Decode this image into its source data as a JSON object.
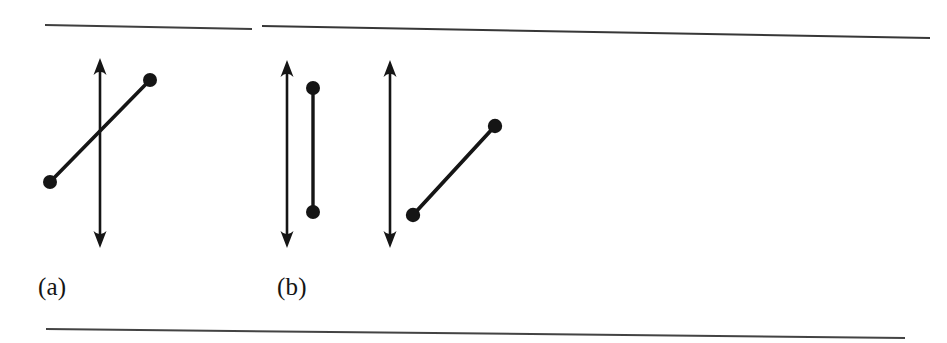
{
  "figure": {
    "kind": "scanned-textbook-figure",
    "background_color": "#ffffff",
    "ink_color": "#151515",
    "width": 947,
    "height": 343,
    "panels": [
      {
        "id": "panel-a",
        "label": "(a)",
        "label_position": {
          "x": 38,
          "y": 274
        },
        "description": "A vertical double-headed arrow crossed by an oblique segment with round endpoints"
      },
      {
        "id": "panel-b",
        "label": "(b)",
        "label_position": {
          "x": 277,
          "y": 274
        },
        "description": "Two vertical double-headed arrows, one beside a vertical segment and one beside an oblique segment, both segments with round endpoints"
      }
    ],
    "rules": [
      {
        "name": "top-rule-left",
        "x1": 45,
        "y1": 25,
        "x2": 252,
        "y2": 29,
        "thickness": 2.0,
        "opacity": 0.82
      },
      {
        "name": "top-rule-right",
        "x1": 262,
        "y1": 26,
        "x2": 930,
        "y2": 38,
        "thickness": 2.0,
        "opacity": 0.85
      },
      {
        "name": "bottom-rule",
        "x1": 46,
        "y1": 329,
        "x2": 905,
        "y2": 338,
        "thickness": 2.0,
        "opacity": 0.8
      }
    ],
    "arrows": [
      {
        "name": "arrow-a-line",
        "panel": "panel-a",
        "x": 100,
        "y_top": 58,
        "y_bottom": 248,
        "thickness": 2.6,
        "head_half_width": 6.5,
        "head_length": 17
      },
      {
        "name": "arrow-b-left-line",
        "panel": "panel-b",
        "x": 287,
        "y_top": 60,
        "y_bottom": 248,
        "thickness": 2.6,
        "head_half_width": 6.5,
        "head_length": 17
      },
      {
        "name": "arrow-b-right-line",
        "panel": "panel-b",
        "x": 390,
        "y_top": 60,
        "y_bottom": 248,
        "thickness": 2.6,
        "head_half_width": 6.5,
        "head_length": 17
      }
    ],
    "segments": [
      {
        "name": "segment-a-oblique",
        "panel": "panel-a",
        "x1": 50,
        "y1": 182,
        "x2": 150,
        "y2": 80,
        "thickness": 3.6,
        "endpoint_radius": 7.0
      },
      {
        "name": "segment-b-vertical",
        "panel": "panel-b",
        "x1": 313,
        "y1": 88,
        "x2": 313,
        "y2": 212,
        "thickness": 3.4,
        "endpoint_radius": 7.0
      },
      {
        "name": "segment-b-oblique",
        "panel": "panel-b",
        "x1": 413,
        "y1": 215,
        "x2": 495,
        "y2": 126,
        "thickness": 3.8,
        "endpoint_radius": 7.2
      }
    ]
  }
}
